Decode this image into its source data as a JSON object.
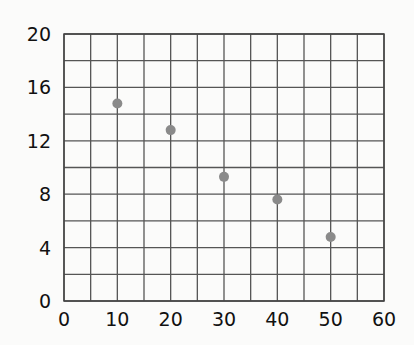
{
  "chart_data": {
    "type": "scatter",
    "title": "",
    "xlabel": "",
    "ylabel": "",
    "xlim": [
      0,
      60
    ],
    "ylim": [
      0,
      20
    ],
    "x_ticks": [
      0,
      10,
      20,
      30,
      40,
      50,
      60
    ],
    "y_ticks": [
      0,
      4,
      8,
      12,
      16,
      20
    ],
    "x_grid_step": 5,
    "y_grid_step": 2,
    "grid": true,
    "legend": null,
    "series": [
      {
        "name": "data",
        "color": "#8a8a8a",
        "points": [
          {
            "x": 10,
            "y": 14.8
          },
          {
            "x": 20,
            "y": 12.8
          },
          {
            "x": 30,
            "y": 9.3
          },
          {
            "x": 40,
            "y": 7.6
          },
          {
            "x": 50,
            "y": 4.8
          }
        ]
      }
    ]
  },
  "colors": {
    "background": "#fbfbfa",
    "grid": "#555555",
    "marker": "#8a8a8a",
    "text": "#111111"
  }
}
